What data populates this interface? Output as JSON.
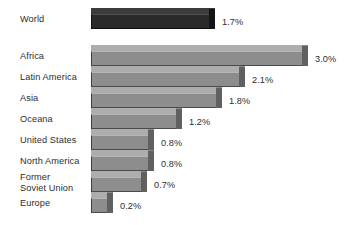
{
  "chart_data": {
    "type": "bar",
    "orientation": "horizontal",
    "title": "",
    "subtitle": "",
    "xlabel": "",
    "ylabel": "",
    "grid": false,
    "legend": "none",
    "axis_visible": false,
    "value_suffix": "%",
    "xlim": [
      0,
      3.0
    ],
    "categories": [
      "World",
      "Africa",
      "Latin America",
      "Asia",
      "Oceana",
      "United States",
      "North America",
      "Former\nSoviet Union",
      "Europe"
    ],
    "values": [
      1.7,
      3.0,
      2.1,
      1.8,
      1.2,
      0.8,
      0.8,
      0.7,
      0.2
    ],
    "value_labels": [
      "1.7%",
      "3.0%",
      "2.1%",
      "1.8%",
      "1.2%",
      "0.8%",
      "0.8%",
      "0.7%",
      "0.2%"
    ],
    "colors": {
      "highlight_bar": "#2a2a2a",
      "bar": "#8d8d8d",
      "bar_top": "#adadad",
      "bar_side": "#606060",
      "text": "#2e2e2e",
      "background": "#ffffff"
    },
    "rows": [
      {
        "label": "World",
        "value": 1.7,
        "value_label": "1.7%",
        "highlight": true,
        "label_y": 14,
        "bar_y": 14,
        "bar_len": 118,
        "label_x": 222,
        "label_lines": 1
      },
      {
        "label": "Africa",
        "value": 3.0,
        "value_label": "3.0%",
        "highlight": false,
        "label_y": 51,
        "bar_y": 51,
        "bar_len": 211,
        "label_x": 315,
        "label_lines": 1
      },
      {
        "label": "Latin America",
        "value": 2.1,
        "value_label": "2.1%",
        "highlight": false,
        "label_y": 72,
        "bar_y": 72,
        "bar_len": 148,
        "label_x": 252,
        "label_lines": 1
      },
      {
        "label": "Asia",
        "value": 1.8,
        "value_label": "1.8%",
        "highlight": false,
        "label_y": 93,
        "bar_y": 93,
        "bar_len": 125,
        "label_x": 229,
        "label_lines": 1
      },
      {
        "label": "Oceana",
        "value": 1.2,
        "value_label": "1.2%",
        "highlight": false,
        "label_y": 114,
        "bar_y": 114,
        "bar_len": 85,
        "label_x": 189,
        "label_lines": 1
      },
      {
        "label": "United States",
        "value": 0.8,
        "value_label": "0.8%",
        "highlight": false,
        "label_y": 135,
        "bar_y": 135,
        "bar_len": 57,
        "label_x": 161,
        "label_lines": 1
      },
      {
        "label": "North America",
        "value": 0.8,
        "value_label": "0.8%",
        "highlight": false,
        "label_y": 156,
        "bar_y": 156,
        "bar_len": 57,
        "label_x": 161,
        "label_lines": 1
      },
      {
        "label": "Former\nSoviet Union",
        "value": 0.7,
        "value_label": "0.7%",
        "highlight": false,
        "label_y": 172,
        "bar_y": 177,
        "bar_len": 50,
        "label_x": 154,
        "label_lines": 2
      },
      {
        "label": "Europe",
        "value": 0.2,
        "value_label": "0.2%",
        "highlight": false,
        "label_y": 198,
        "bar_y": 198,
        "bar_len": 16,
        "label_x": 120,
        "label_lines": 1
      }
    ]
  }
}
